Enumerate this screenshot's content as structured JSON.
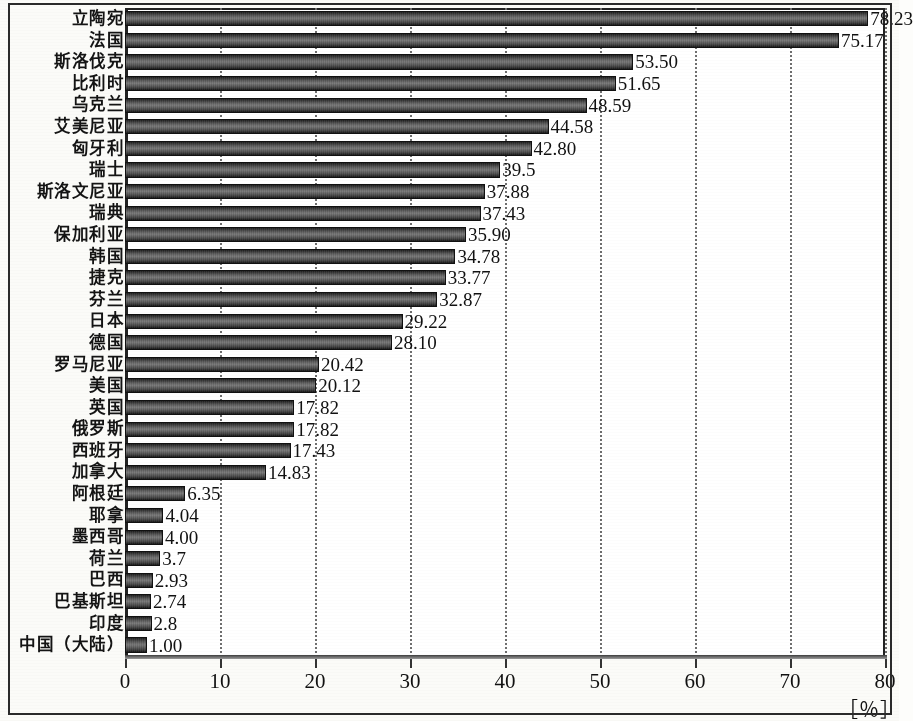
{
  "chart_data": {
    "type": "bar",
    "orientation": "horizontal",
    "title": "",
    "xlabel": "[％]",
    "ylabel": "",
    "xlim": [
      0,
      80
    ],
    "xticks": [
      0,
      10,
      20,
      30,
      40,
      50,
      60,
      70,
      80
    ],
    "xtick_labels": [
      "0",
      "10",
      "20",
      "30",
      "40",
      "50",
      "60",
      "70",
      "80"
    ],
    "grid": "vertical-dotted",
    "legend": "none",
    "categories": [
      "立陶宛",
      "法国",
      "斯洛伐克",
      "比利时",
      "乌克兰",
      "艾美尼亚",
      "匈牙利",
      "瑞士",
      "斯洛文尼亚",
      "瑞典",
      "保加利亚",
      "韩国",
      "捷克",
      "芬兰",
      "日本",
      "德国",
      "罗马尼亚",
      "美国",
      "英国",
      "俄罗斯",
      "西班牙",
      "加拿大",
      "阿根廷",
      "耶拿",
      "墨西哥",
      "荷兰",
      "巴西",
      "巴基斯坦",
      "印度",
      "中国（大陆）"
    ],
    "values": [
      78.23,
      75.17,
      53.5,
      51.65,
      48.59,
      44.58,
      42.8,
      39.5,
      37.88,
      37.43,
      35.9,
      34.78,
      33.77,
      32.87,
      29.22,
      28.1,
      20.42,
      20.12,
      17.82,
      17.82,
      17.43,
      14.83,
      6.35,
      4.04,
      4.0,
      3.7,
      2.93,
      2.74,
      2.8,
      1.0
    ],
    "value_labels": [
      "78.23",
      "75.17",
      "53.50",
      "51.65",
      "48.59",
      "44.58",
      "42.80",
      "39.5",
      "37.88",
      "37.43",
      "35.90",
      "34.78",
      "33.77",
      "32.87",
      "29.22",
      "28.10",
      "20.42",
      "20.12",
      "17.82",
      "17.82",
      "17.43",
      "14.83",
      "6.35",
      "4.04",
      "4.00",
      "3.7",
      "2.93",
      "2.74",
      "2.8",
      "1.00"
    ],
    "bar_color": "#555555",
    "axis_color": "#222222",
    "grid_color": "#6e6e6e"
  },
  "axis": {
    "unit": "［％］"
  }
}
